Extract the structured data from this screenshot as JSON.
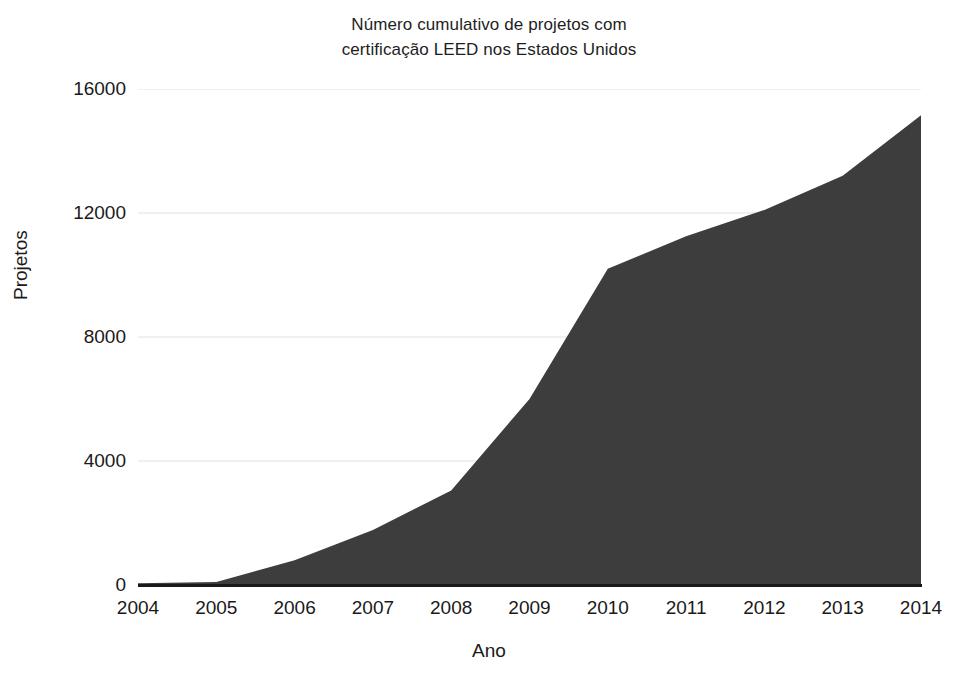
{
  "chart_data": {
    "type": "area",
    "title": "Número cumulativo de projetos com certificação LEED nos Estados Unidos",
    "title_lines": [
      "Número cumulativo de projetos com",
      "certificação LEED nos Estados Unidos"
    ],
    "xlabel": "Ano",
    "ylabel": "Projetos",
    "categories": [
      2004,
      2005,
      2006,
      2007,
      2008,
      2009,
      2010,
      2011,
      2012,
      2013,
      2014
    ],
    "x_tick_labels": [
      "2004",
      "2005",
      "2006",
      "2007",
      "2008",
      "2009",
      "2010",
      "2011",
      "2012",
      "2013",
      "2014"
    ],
    "values": [
      60,
      100,
      800,
      1775,
      3050,
      6000,
      10200,
      11250,
      12100,
      13200,
      15150
    ],
    "y_tick_labels": [
      "0",
      "4000",
      "8000",
      "12000",
      "16000"
    ],
    "y_ticks": [
      0,
      4000,
      8000,
      12000,
      16000
    ],
    "ylim": [
      0,
      16000
    ],
    "xlim": [
      2004,
      2014
    ],
    "grid": true,
    "legend": false,
    "series": [
      {
        "name": "Projetos certificados LEED (cumulativo)",
        "values": [
          60,
          100,
          800,
          1775,
          3050,
          6000,
          10200,
          11250,
          12100,
          13200,
          15150
        ]
      }
    ],
    "colors": {
      "area_fill": "#3d3d3d",
      "grid": "#e2e2e2",
      "axis": "#1a1a1a",
      "background": "#ffffff",
      "text": "#1a1a1a"
    }
  }
}
